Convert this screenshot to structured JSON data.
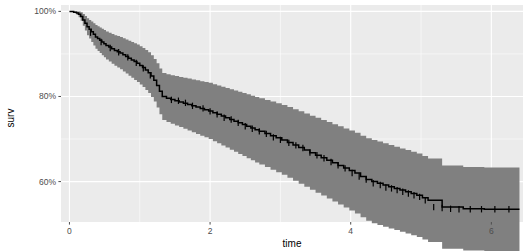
{
  "chart_data": {
    "type": "line",
    "title": "",
    "subtitle": "",
    "xlabel": "time",
    "ylabel": "surv",
    "xlim": [
      -0.12,
      6.45
    ],
    "ylim": [
      0.505,
      1.015
    ],
    "grid": true,
    "legend": false,
    "legend_position": "none",
    "x_ticks": [
      0,
      2,
      4,
      6
    ],
    "x_tick_labels": [
      "0",
      "2",
      "4",
      "6"
    ],
    "y_ticks": [
      0.6,
      0.8,
      1.0
    ],
    "y_tick_labels": [
      "60%",
      "80%",
      "100%"
    ],
    "panel_background": "#ebebeb",
    "grid_color": "#ffffff",
    "line_color": "#000000",
    "band_color": "#808080",
    "band_opacity": 1,
    "series": [
      {
        "name": "surv",
        "style": "step",
        "x": [
          0.0,
          0.06,
          0.1,
          0.13,
          0.16,
          0.19,
          0.22,
          0.25,
          0.28,
          0.31,
          0.34,
          0.37,
          0.4,
          0.43,
          0.46,
          0.49,
          0.52,
          0.56,
          0.6,
          0.64,
          0.68,
          0.72,
          0.76,
          0.8,
          0.84,
          0.88,
          0.92,
          0.96,
          1.0,
          1.04,
          1.08,
          1.12,
          1.16,
          1.2,
          1.24,
          1.28,
          1.32,
          1.38,
          1.44,
          1.5,
          1.56,
          1.62,
          1.68,
          1.74,
          1.8,
          1.86,
          1.92,
          1.98,
          2.04,
          2.1,
          2.16,
          2.22,
          2.28,
          2.34,
          2.4,
          2.46,
          2.52,
          2.58,
          2.64,
          2.7,
          2.78,
          2.86,
          2.94,
          3.02,
          3.1,
          3.18,
          3.26,
          3.34,
          3.42,
          3.5,
          3.58,
          3.66,
          3.74,
          3.82,
          3.9,
          3.98,
          4.06,
          4.14,
          4.22,
          4.3,
          4.38,
          4.46,
          4.54,
          4.62,
          4.7,
          4.78,
          4.86,
          4.94,
          5.02,
          5.1,
          5.3,
          5.6,
          5.9,
          6.2,
          6.4
        ],
        "y": [
          1.0,
          0.998,
          0.996,
          0.993,
          0.988,
          0.98,
          0.972,
          0.964,
          0.958,
          0.952,
          0.946,
          0.94,
          0.936,
          0.932,
          0.928,
          0.924,
          0.92,
          0.916,
          0.912,
          0.908,
          0.905,
          0.902,
          0.898,
          0.894,
          0.89,
          0.886,
          0.882,
          0.878,
          0.873,
          0.868,
          0.862,
          0.856,
          0.848,
          0.838,
          0.826,
          0.812,
          0.8,
          0.796,
          0.793,
          0.79,
          0.787,
          0.784,
          0.781,
          0.778,
          0.775,
          0.772,
          0.769,
          0.766,
          0.762,
          0.758,
          0.754,
          0.75,
          0.746,
          0.742,
          0.738,
          0.734,
          0.73,
          0.726,
          0.722,
          0.718,
          0.713,
          0.708,
          0.703,
          0.698,
          0.692,
          0.686,
          0.68,
          0.674,
          0.668,
          0.662,
          0.656,
          0.65,
          0.644,
          0.638,
          0.632,
          0.626,
          0.62,
          0.612,
          0.605,
          0.6,
          0.596,
          0.592,
          0.588,
          0.584,
          0.58,
          0.576,
          0.572,
          0.568,
          0.562,
          0.556,
          0.54,
          0.536,
          0.535,
          0.535,
          0.535
        ]
      }
    ],
    "confidence_band": {
      "name": "95% confidence interval",
      "x": [
        0.0,
        0.06,
        0.1,
        0.13,
        0.16,
        0.19,
        0.22,
        0.25,
        0.28,
        0.31,
        0.34,
        0.37,
        0.4,
        0.43,
        0.46,
        0.49,
        0.52,
        0.56,
        0.6,
        0.64,
        0.68,
        0.72,
        0.76,
        0.8,
        0.84,
        0.88,
        0.92,
        0.96,
        1.0,
        1.04,
        1.08,
        1.12,
        1.16,
        1.2,
        1.24,
        1.28,
        1.32,
        1.38,
        1.44,
        1.5,
        1.56,
        1.62,
        1.68,
        1.74,
        1.8,
        1.86,
        1.92,
        1.98,
        2.04,
        2.1,
        2.16,
        2.22,
        2.28,
        2.34,
        2.4,
        2.46,
        2.52,
        2.58,
        2.64,
        2.7,
        2.78,
        2.86,
        2.94,
        3.02,
        3.1,
        3.18,
        3.26,
        3.34,
        3.42,
        3.5,
        3.58,
        3.66,
        3.74,
        3.82,
        3.9,
        3.98,
        4.06,
        4.14,
        4.22,
        4.3,
        4.38,
        4.46,
        4.54,
        4.62,
        4.7,
        4.78,
        4.86,
        4.94,
        5.02,
        5.1,
        5.3,
        5.6,
        5.9,
        6.2,
        6.4
      ],
      "lower": [
        1.0,
        0.996,
        0.992,
        0.986,
        0.978,
        0.966,
        0.955,
        0.944,
        0.936,
        0.928,
        0.92,
        0.912,
        0.907,
        0.902,
        0.897,
        0.892,
        0.887,
        0.882,
        0.877,
        0.872,
        0.868,
        0.864,
        0.859,
        0.854,
        0.849,
        0.844,
        0.839,
        0.834,
        0.828,
        0.822,
        0.815,
        0.808,
        0.799,
        0.788,
        0.774,
        0.758,
        0.745,
        0.74,
        0.736,
        0.732,
        0.728,
        0.724,
        0.72,
        0.716,
        0.712,
        0.708,
        0.704,
        0.7,
        0.695,
        0.69,
        0.685,
        0.68,
        0.675,
        0.67,
        0.665,
        0.66,
        0.655,
        0.65,
        0.645,
        0.64,
        0.634,
        0.628,
        0.622,
        0.616,
        0.609,
        0.602,
        0.595,
        0.588,
        0.581,
        0.574,
        0.567,
        0.56,
        0.553,
        0.546,
        0.539,
        0.532,
        0.525,
        0.516,
        0.508,
        0.502,
        0.498,
        0.494,
        0.49,
        0.486,
        0.482,
        0.478,
        0.474,
        0.47,
        0.464,
        0.458,
        0.442,
        0.438,
        0.437,
        0.437,
        0.437
      ],
      "upper": [
        1.0,
        1.0,
        1.0,
        1.0,
        0.998,
        0.994,
        0.989,
        0.984,
        0.98,
        0.976,
        0.972,
        0.968,
        0.965,
        0.962,
        0.959,
        0.956,
        0.953,
        0.95,
        0.947,
        0.944,
        0.942,
        0.94,
        0.937,
        0.934,
        0.931,
        0.928,
        0.925,
        0.922,
        0.918,
        0.914,
        0.909,
        0.904,
        0.897,
        0.888,
        0.878,
        0.866,
        0.855,
        0.852,
        0.85,
        0.848,
        0.846,
        0.844,
        0.842,
        0.84,
        0.838,
        0.836,
        0.834,
        0.832,
        0.829,
        0.826,
        0.823,
        0.82,
        0.817,
        0.814,
        0.811,
        0.808,
        0.805,
        0.802,
        0.799,
        0.796,
        0.792,
        0.788,
        0.784,
        0.78,
        0.775,
        0.77,
        0.765,
        0.76,
        0.755,
        0.75,
        0.745,
        0.74,
        0.735,
        0.73,
        0.725,
        0.72,
        0.715,
        0.708,
        0.702,
        0.698,
        0.694,
        0.69,
        0.686,
        0.682,
        0.678,
        0.674,
        0.67,
        0.666,
        0.66,
        0.654,
        0.638,
        0.634,
        0.633,
        0.633,
        0.633
      ]
    },
    "censor_marks": {
      "name": "censoring ticks",
      "x": [
        0.3,
        0.45,
        0.58,
        0.7,
        0.83,
        0.95,
        1.05,
        1.15,
        1.45,
        1.55,
        1.65,
        1.75,
        1.9,
        2.0,
        2.1,
        2.2,
        2.3,
        2.4,
        2.5,
        2.6,
        2.7,
        2.8,
        2.9,
        3.0,
        3.12,
        3.22,
        3.32,
        3.42,
        3.52,
        3.62,
        3.72,
        3.82,
        3.92,
        4.02,
        4.12,
        4.22,
        4.32,
        4.42,
        4.5,
        4.58,
        4.66,
        4.74,
        4.82,
        4.9,
        4.98,
        5.06,
        5.18,
        5.3,
        5.42,
        5.54,
        5.7,
        5.86,
        6.05,
        6.25
      ],
      "y": [
        0.95,
        0.928,
        0.914,
        0.904,
        0.892,
        0.879,
        0.866,
        0.85,
        0.792,
        0.79,
        0.785,
        0.778,
        0.772,
        0.765,
        0.758,
        0.75,
        0.746,
        0.738,
        0.73,
        0.724,
        0.718,
        0.712,
        0.704,
        0.698,
        0.691,
        0.685,
        0.679,
        0.668,
        0.662,
        0.655,
        0.646,
        0.638,
        0.631,
        0.62,
        0.612,
        0.605,
        0.596,
        0.592,
        0.586,
        0.584,
        0.58,
        0.576,
        0.572,
        0.568,
        0.564,
        0.556,
        0.54,
        0.538,
        0.536,
        0.535,
        0.535,
        0.535,
        0.535,
        0.535
      ]
    }
  },
  "axes": {
    "y_title": "surv",
    "x_title": "time",
    "y_labels": [
      "100%",
      "80%",
      "60%"
    ],
    "x_labels": [
      "0",
      "2",
      "4",
      "6"
    ]
  }
}
